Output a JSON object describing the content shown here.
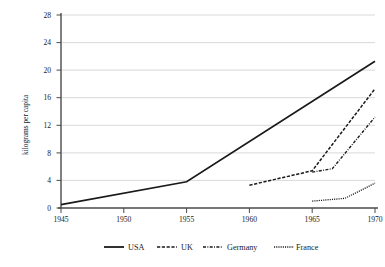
{
  "chart_data": {
    "type": "line",
    "title": "",
    "xlabel": "",
    "ylabel": "kilograms per capita",
    "xlim": [
      1945,
      1970
    ],
    "ylim": [
      0,
      28
    ],
    "xticks": [
      1945,
      1950,
      1955,
      1960,
      1965,
      1970
    ],
    "yticks": [
      0,
      4,
      8,
      12,
      16,
      20,
      24,
      28
    ],
    "grid": "horizontal",
    "legend_position": "bottom",
    "series": [
      {
        "name": "USA",
        "style": "solid",
        "x": [
          1945,
          1955,
          1970
        ],
        "values": [
          0.5,
          3.8,
          21.3
        ]
      },
      {
        "name": "UK",
        "style": "dashed",
        "x": [
          1960,
          1965,
          1970
        ],
        "values": [
          3.3,
          5.4,
          17.3
        ]
      },
      {
        "name": "Germany",
        "style": "dash-dot",
        "x": [
          1965,
          1966.6,
          1970
        ],
        "values": [
          5.2,
          5.7,
          13.2
        ]
      },
      {
        "name": "France",
        "style": "dotted",
        "x": [
          1965,
          1967.6,
          1970
        ],
        "values": [
          1.0,
          1.4,
          3.6
        ]
      }
    ]
  },
  "axis": {
    "y_title": "kilograms per capita",
    "y_tick_labels": [
      "28",
      "24",
      "20",
      "16",
      "12",
      "8",
      "4",
      "0"
    ],
    "x_tick_labels": [
      "1945",
      "1950",
      "1955",
      "1960",
      "1965",
      "1970"
    ]
  },
  "legend": {
    "items": [
      {
        "label": "USA"
      },
      {
        "label": "UK"
      },
      {
        "label": "Germany"
      },
      {
        "label": "France"
      }
    ]
  }
}
